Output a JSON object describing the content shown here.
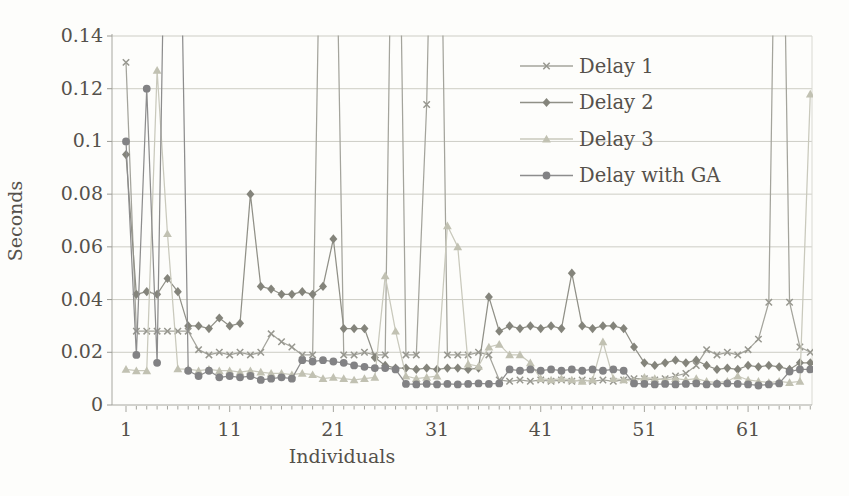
{
  "figure": {
    "kind": "scanned-line-chart",
    "background": "#fdfdfb",
    "text_color": "#55514b",
    "grid_color": "#cdcdc5",
    "axis_color": "#a7a7a0",
    "tick_color": "#9b9b94"
  },
  "chart_data": {
    "type": "line",
    "title": "",
    "xlabel": "Individuals",
    "ylabel": "Seconds",
    "x_start": 1,
    "x_end": 67,
    "ylim": [
      0,
      0.14
    ],
    "clipped_above": 0.14,
    "grid": "horizontal",
    "legend_position": "top-right",
    "y_ticks": {
      "values": [
        0,
        0.02,
        0.04,
        0.06,
        0.08,
        0.1,
        0.12,
        0.14
      ],
      "labels": [
        "0",
        "0.02",
        "0.04",
        "0.06",
        "0.08",
        "0.1",
        "0.12",
        "0.14"
      ]
    },
    "x_tick_labels": [
      "1",
      "11",
      "21",
      "31",
      "41",
      "51",
      "61"
    ],
    "x_tick_label_values": [
      1,
      11,
      21,
      31,
      41,
      51,
      61
    ],
    "series": [
      {
        "name": "Delay 1",
        "marker": "x",
        "color": "#a4a49c",
        "marker_color": "#97978f",
        "values": [
          0.13,
          0.028,
          0.028,
          0.028,
          0.028,
          0.028,
          0.028,
          0.021,
          0.019,
          0.02,
          0.019,
          0.02,
          0.019,
          0.02,
          0.027,
          0.024,
          0.022,
          0.019,
          0.019,
          0.25,
          0.25,
          0.019,
          0.019,
          0.02,
          0.019,
          0.019,
          0.3,
          0.019,
          0.019,
          0.114,
          0.3,
          0.019,
          0.019,
          0.019,
          0.02,
          0.019,
          0.0095,
          0.009,
          0.0095,
          0.009,
          0.0095,
          0.009,
          0.0095,
          0.009,
          0.0095,
          0.009,
          0.0095,
          0.009,
          0.0095,
          0.01,
          0.01,
          0.0095,
          0.01,
          0.011,
          0.012,
          0.015,
          0.021,
          0.019,
          0.02,
          0.019,
          0.021,
          0.025,
          0.039,
          0.3,
          0.039,
          0.022,
          0.02
        ]
      },
      {
        "name": "Delay 2",
        "marker": "diamond",
        "color": "#909087",
        "marker_color": "#84847b",
        "values": [
          0.095,
          0.042,
          0.043,
          0.042,
          0.048,
          0.043,
          0.03,
          0.03,
          0.029,
          0.033,
          0.03,
          0.031,
          0.08,
          0.045,
          0.044,
          0.042,
          0.042,
          0.043,
          0.042,
          0.045,
          0.063,
          0.029,
          0.029,
          0.029,
          0.018,
          0.015,
          0.014,
          0.014,
          0.0135,
          0.014,
          0.0135,
          0.014,
          0.014,
          0.0135,
          0.014,
          0.041,
          0.028,
          0.03,
          0.029,
          0.03,
          0.029,
          0.03,
          0.029,
          0.05,
          0.03,
          0.029,
          0.03,
          0.03,
          0.029,
          0.022,
          0.016,
          0.015,
          0.016,
          0.017,
          0.016,
          0.017,
          0.015,
          0.0135,
          0.014,
          0.0135,
          0.015,
          0.0145,
          0.015,
          0.0145,
          0.0135,
          0.016,
          0.016
        ]
      },
      {
        "name": "Delay 3",
        "marker": "triangle",
        "color": "#c9c9bc",
        "marker_color": "#c1c1b2",
        "values": [
          0.0135,
          0.013,
          0.013,
          0.127,
          0.065,
          0.0137,
          0.0136,
          0.013,
          0.0135,
          0.013,
          0.013,
          0.0125,
          0.013,
          0.0125,
          0.012,
          0.012,
          0.0115,
          0.012,
          0.0115,
          0.01,
          0.0105,
          0.01,
          0.0095,
          0.01,
          0.0105,
          0.049,
          0.028,
          0.011,
          0.01,
          0.0105,
          0.011,
          0.068,
          0.06,
          0.0155,
          0.0147,
          0.022,
          0.023,
          0.019,
          0.019,
          0.016,
          0.01,
          0.0095,
          0.01,
          0.0095,
          0.009,
          0.0095,
          0.024,
          0.01,
          0.0095,
          0.009,
          0.0105,
          0.01,
          0.0095,
          0.01,
          0.0095,
          0.01,
          0.009,
          0.0085,
          0.009,
          0.011,
          0.0095,
          0.009,
          0.0085,
          0.009,
          0.0085,
          0.009,
          0.118
        ]
      },
      {
        "name": "Delay with GA",
        "marker": "circle",
        "color": "#8d8d8d",
        "marker_color": "#828284",
        "values": [
          0.1,
          0.019,
          0.12,
          0.016,
          0.25,
          0.25,
          0.013,
          0.011,
          0.013,
          0.0105,
          0.011,
          0.0105,
          0.011,
          0.0095,
          0.01,
          0.0105,
          0.01,
          0.017,
          0.0165,
          0.017,
          0.0165,
          0.016,
          0.015,
          0.0145,
          0.014,
          0.014,
          0.0135,
          0.008,
          0.0078,
          0.008,
          0.0078,
          0.008,
          0.0078,
          0.008,
          0.0082,
          0.008,
          0.0082,
          0.0135,
          0.013,
          0.0135,
          0.013,
          0.0135,
          0.013,
          0.0135,
          0.013,
          0.0135,
          0.013,
          0.0135,
          0.013,
          0.0082,
          0.008,
          0.0078,
          0.008,
          0.0078,
          0.008,
          0.0082,
          0.0078,
          0.008,
          0.0082,
          0.008,
          0.0078,
          0.0074,
          0.0078,
          0.0082,
          0.0127,
          0.0135,
          0.0135
        ]
      }
    ]
  }
}
